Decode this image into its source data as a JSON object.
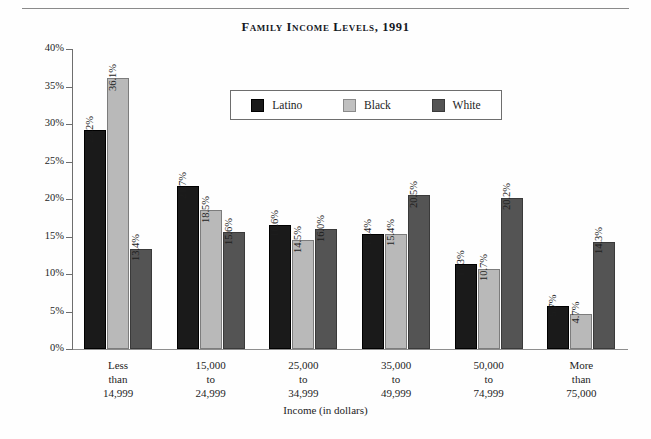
{
  "chart_data": {
    "type": "bar",
    "title": "Family Income Levels, 1991",
    "xlabel": "Income (in dollars)",
    "ylabel": "Percentage of Families",
    "ylim": [
      0,
      40
    ],
    "yticks": [
      "0%",
      "5%",
      "10%",
      "15%",
      "20%",
      "25%",
      "30%",
      "35%",
      "40%"
    ],
    "ytick_values": [
      0,
      5,
      10,
      15,
      20,
      25,
      30,
      35,
      40
    ],
    "grid": false,
    "legend_position": "upper-center-inside",
    "categories": [
      [
        "Less",
        "than",
        "14,999"
      ],
      [
        "15,000",
        "to",
        "24,999"
      ],
      [
        "25,000",
        "to",
        "34,999"
      ],
      [
        "35,000",
        "to",
        "49,999"
      ],
      [
        "50,000",
        "to",
        "74,999"
      ],
      [
        "More",
        "than",
        "75,000"
      ]
    ],
    "series": [
      {
        "name": "Latino",
        "color": "#1a1a1a",
        "values": [
          29.2,
          21.7,
          16.6,
          15.4,
          11.3,
          5.7
        ],
        "labels": [
          "29.2%",
          "21.7%",
          "16.6%",
          "15.4%",
          "11.3%",
          "5.7%"
        ]
      },
      {
        "name": "Black",
        "color": "#b9b9b9",
        "values": [
          36.1,
          18.5,
          14.5,
          15.4,
          10.7,
          4.7
        ],
        "labels": [
          "36.1%",
          "18.5%",
          "14.5%",
          "15.4%",
          "10.7%",
          "4.7%"
        ]
      },
      {
        "name": "White",
        "color": "#545454",
        "values": [
          13.4,
          15.6,
          16.0,
          20.5,
          20.2,
          14.3
        ],
        "labels": [
          "13.4%",
          "15.6%",
          "16.0%",
          "20.5%",
          "20.2%",
          "14.3%"
        ]
      }
    ]
  }
}
